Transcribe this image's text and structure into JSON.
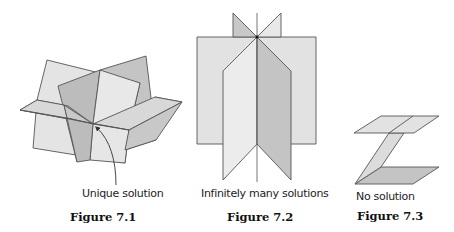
{
  "figures": [
    {
      "id": "7.1",
      "caption": "Unique solution",
      "label": "Figure 7.1"
    },
    {
      "id": "7.2",
      "caption": "Infinitely many solutions",
      "label": "Figure 7.2"
    },
    {
      "id": "7.3",
      "caption": "No solution",
      "label": "Figure 7.3"
    }
  ],
  "colors": {
    "light_plane": "#e6e6e6",
    "mid_plane": "#d6d6d6",
    "dark_plane": "#bdbdbd",
    "edge": "#555555"
  }
}
